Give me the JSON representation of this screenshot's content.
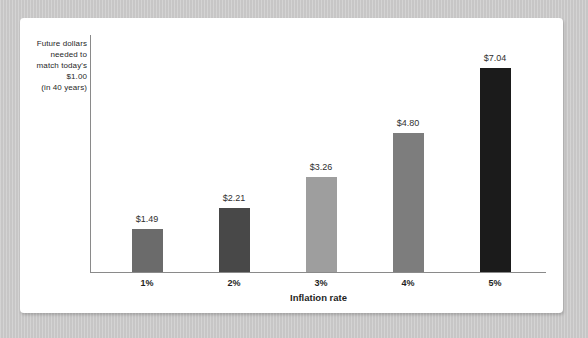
{
  "chart_data": {
    "type": "bar",
    "title_lines": [
      "Future dollars",
      "needed to",
      "match today's",
      "$1.00",
      "(in 40 years)"
    ],
    "xlabel": "Inflation rate",
    "ylabel": "",
    "categories": [
      "1%",
      "2%",
      "3%",
      "4%",
      "5%"
    ],
    "values": [
      1.49,
      2.21,
      3.26,
      4.8,
      7.04
    ],
    "value_labels": [
      "$1.49",
      "$2.21",
      "$3.26",
      "$4.80",
      "$7.04"
    ],
    "bar_colors": [
      "#6b6b6b",
      "#484848",
      "#9e9e9e",
      "#7d7d7d",
      "#1b1b1b"
    ],
    "ylim": [
      0,
      7.5
    ],
    "grid": false,
    "legend": null
  },
  "colors": {
    "page_background": "#cbcaca",
    "card_background": "#ffffff",
    "axis": "#8a8a8a",
    "value_label_text": "#2f2f2f",
    "tick_text": "#1f1f1f"
  }
}
